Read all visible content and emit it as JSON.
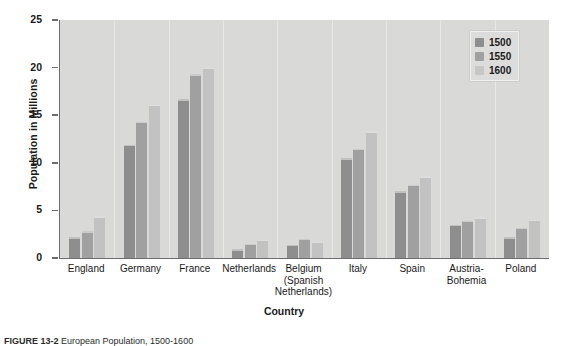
{
  "figure": {
    "caption_label": "FIGURE 13-2",
    "caption_text": "European Population, 1500-1600"
  },
  "legend": {
    "position": "top-right",
    "entries": [
      {
        "label": "1500",
        "swatch": "legend-swatch-1500",
        "color": "#8e8e8e"
      },
      {
        "label": "1550",
        "swatch": "legend-swatch-1550",
        "color": "#a0a0a0"
      },
      {
        "label": "1600",
        "swatch": "legend-swatch-1600",
        "color": "#c6c6c6"
      }
    ]
  },
  "chart_data": {
    "type": "bar",
    "title": "",
    "xlabel": "Country",
    "ylabel": "Population in Millions",
    "ylim": [
      0,
      25
    ],
    "yticks": [
      0,
      5,
      10,
      15,
      20,
      25
    ],
    "grid": false,
    "legend_position": "top-right",
    "plot_background": "#d9d9d7",
    "categories": [
      "England",
      "Germany",
      "France",
      "Netherlands",
      "Belgium\n(Spanish\nNetherlands)",
      "Italy",
      "Spain",
      "Austria-\nBohemia",
      "Poland"
    ],
    "series": [
      {
        "name": "1500",
        "color": "#8e8e8e",
        "values": [
          2.2,
          11.9,
          16.7,
          0.9,
          1.4,
          10.5,
          7.0,
          3.5,
          2.2
        ]
      },
      {
        "name": "1550",
        "color": "#a0a0a0",
        "values": [
          2.8,
          14.3,
          19.3,
          1.5,
          2.0,
          11.5,
          7.7,
          3.9,
          3.2
        ]
      },
      {
        "name": "1600",
        "color": "#c2c2c2",
        "values": [
          4.4,
          16.1,
          20.0,
          1.9,
          1.7,
          13.3,
          8.6,
          4.3,
          4.0
        ]
      }
    ]
  }
}
